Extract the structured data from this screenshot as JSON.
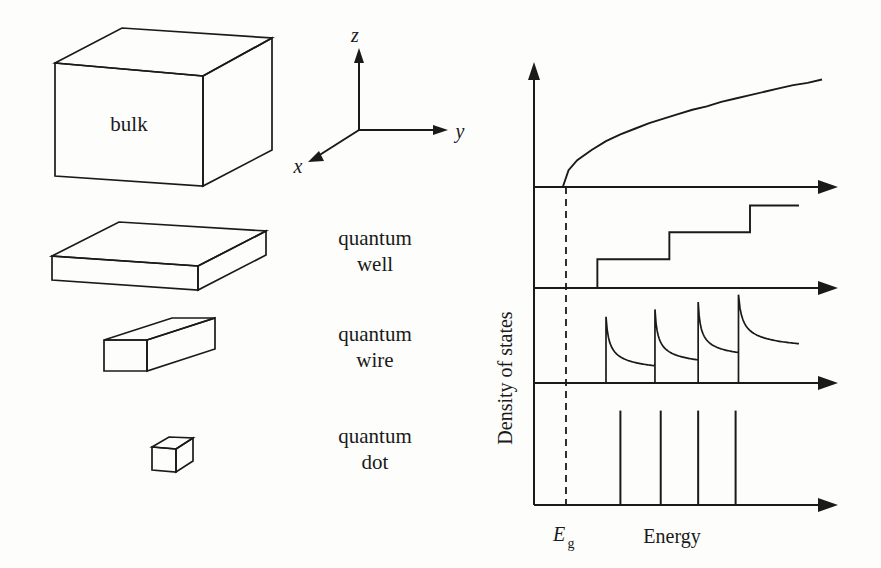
{
  "figure": {
    "title_text": "",
    "ink_color": "#1a1a1a",
    "background": "#fdfdfc"
  },
  "structures": [
    {
      "id": "bulk",
      "label_line1": "bulk",
      "label_line2": "",
      "inside_label": "bulk",
      "dimensionality": "3D"
    },
    {
      "id": "quantum-well",
      "label_line1": "quantum",
      "label_line2": "well",
      "inside_label": "",
      "dimensionality": "2D"
    },
    {
      "id": "quantum-wire",
      "label_line1": "quantum",
      "label_line2": "wire",
      "inside_label": "",
      "dimensionality": "1D"
    },
    {
      "id": "quantum-dot",
      "label_line1": "quantum",
      "label_line2": "dot",
      "inside_label": "",
      "dimensionality": "0D"
    }
  ],
  "axes_triad": {
    "z_label": "z",
    "y_label": "y",
    "x_label": "x"
  },
  "plot_labels": {
    "y_axis": "Density of states",
    "x_axis": "Energy",
    "gap_marker": "E",
    "gap_marker_sub": "g"
  },
  "chart_data": {
    "type": "line",
    "xlabel": "Energy",
    "ylabel": "Density of states",
    "grid": false,
    "legend": "none",
    "xlim": [
      0,
      1
    ],
    "ylim": [
      0,
      1
    ],
    "band_gap": {
      "label": "Eg",
      "x": 0.1,
      "style": "dashed-vertical"
    },
    "panels": [
      {
        "name": "bulk",
        "dimensionality": "3D",
        "form": "sqrt",
        "description": "D(E) proportional to sqrt(E - Eg), continuous rising curve starting at Eg",
        "x": [
          0.1,
          0.12,
          0.15,
          0.2,
          0.25,
          0.3,
          0.35,
          0.4,
          0.45,
          0.5,
          0.55,
          0.6,
          0.65,
          0.7,
          0.75,
          0.8,
          0.85,
          0.9,
          0.95,
          1.0
        ],
        "y": [
          0.0,
          0.15,
          0.24,
          0.33,
          0.41,
          0.47,
          0.52,
          0.57,
          0.61,
          0.65,
          0.69,
          0.72,
          0.76,
          0.79,
          0.82,
          0.85,
          0.88,
          0.91,
          0.93,
          0.96
        ]
      },
      {
        "name": "quantum well",
        "dimensionality": "2D",
        "form": "staircase",
        "description": "D(E) constant steps of equal height at each subband edge",
        "step_edges": [
          0.22,
          0.47,
          0.75
        ],
        "step_levels": [
          0.0,
          0.3,
          0.58,
          0.86
        ],
        "end_x": 0.92
      },
      {
        "name": "quantum wire",
        "dimensionality": "1D",
        "form": "inverse-sqrt-sawtooth",
        "description": "D(E) proportional to 1/sqrt(E - En) diverging at each subband edge then decaying",
        "peak_positions": [
          0.25,
          0.42,
          0.57,
          0.71
        ],
        "peak_heights": [
          0.72,
          0.8,
          0.88,
          0.96
        ],
        "decay_floor": [
          0.06,
          0.12,
          0.2,
          0.3
        ],
        "segment_end": [
          0.42,
          0.57,
          0.71,
          0.92
        ]
      },
      {
        "name": "quantum dot",
        "dimensionality": "0D",
        "form": "delta",
        "description": "D(E) discrete delta functions at each confined level",
        "delta_positions": [
          0.3,
          0.44,
          0.57,
          0.7
        ],
        "delta_heights": [
          0.8,
          0.8,
          0.8,
          0.8
        ]
      }
    ]
  }
}
